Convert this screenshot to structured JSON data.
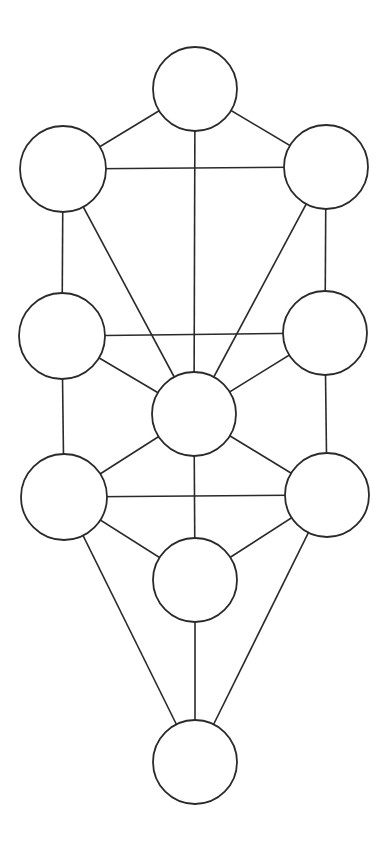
{
  "diagram": {
    "type": "graph",
    "stroke_color": "#2a2a2a",
    "background": "#ffffff",
    "nodes": [
      {
        "id": "n1",
        "x": 195,
        "y": 89,
        "r": 42
      },
      {
        "id": "n2",
        "x": 326,
        "y": 167,
        "r": 42
      },
      {
        "id": "n3",
        "x": 63,
        "y": 169,
        "r": 43
      },
      {
        "id": "n4",
        "x": 325,
        "y": 333,
        "r": 42
      },
      {
        "id": "n5",
        "x": 62,
        "y": 336,
        "r": 43
      },
      {
        "id": "n6",
        "x": 194,
        "y": 414,
        "r": 42
      },
      {
        "id": "n7",
        "x": 327,
        "y": 495,
        "r": 42
      },
      {
        "id": "n8",
        "x": 64,
        "y": 497,
        "r": 43
      },
      {
        "id": "n9",
        "x": 195,
        "y": 580,
        "r": 42
      },
      {
        "id": "n10",
        "x": 195,
        "y": 762,
        "r": 42
      }
    ],
    "edges": [
      [
        "n1",
        "n2"
      ],
      [
        "n1",
        "n3"
      ],
      [
        "n1",
        "n6"
      ],
      [
        "n2",
        "n3"
      ],
      [
        "n3",
        "n5"
      ],
      [
        "n3",
        "n6"
      ],
      [
        "n2",
        "n4"
      ],
      [
        "n2",
        "n6"
      ],
      [
        "n4",
        "n5"
      ],
      [
        "n5",
        "n6"
      ],
      [
        "n4",
        "n6"
      ],
      [
        "n5",
        "n8"
      ],
      [
        "n4",
        "n7"
      ],
      [
        "n6",
        "n8"
      ],
      [
        "n6",
        "n7"
      ],
      [
        "n6",
        "n9"
      ],
      [
        "n7",
        "n8"
      ],
      [
        "n8",
        "n9"
      ],
      [
        "n7",
        "n9"
      ],
      [
        "n8",
        "n10"
      ],
      [
        "n7",
        "n10"
      ],
      [
        "n9",
        "n10"
      ]
    ]
  }
}
